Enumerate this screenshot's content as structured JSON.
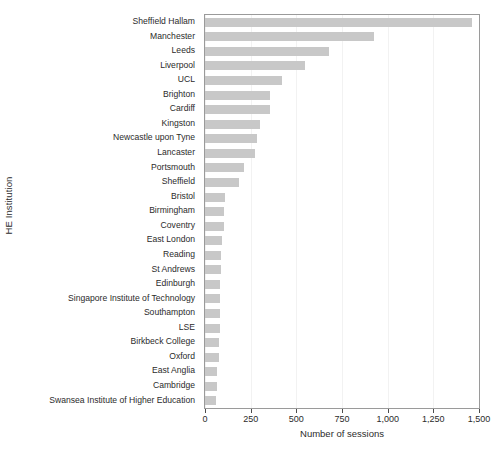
{
  "chart_data": {
    "type": "bar",
    "orientation": "horizontal",
    "title": "",
    "xlabel": "Number of sessions",
    "ylabel": "HE Institution",
    "xlim": [
      0,
      1500
    ],
    "ylim": null,
    "grid": true,
    "legend": null,
    "bar_color": "#c8c8c8",
    "panel_border_color": "#9a9a9a",
    "xticks": [
      0,
      250,
      500,
      750,
      1000,
      1250,
      1500
    ],
    "xticklabels": [
      "0",
      "250",
      "500",
      "750",
      "1,000",
      "1,250",
      "1,500"
    ],
    "categories": [
      "Sheffield Hallam",
      "Manchester",
      "Leeds",
      "Liverpool",
      "UCL",
      "Brighton",
      "Cardiff",
      "Kingston",
      "Newcastle upon Tyne",
      "Lancaster",
      "Portsmouth",
      "Sheffield",
      "Bristol",
      "Birmingham",
      "Coventry",
      "East London",
      "Reading",
      "St Andrews",
      "Edinburgh",
      "Singapore Institute of Technology",
      "Southampton",
      "LSE",
      "Birkbeck College",
      "Oxford",
      "East Anglia",
      "Cambridge",
      "Swansea Institute of Higher Education"
    ],
    "values": [
      1460,
      925,
      680,
      550,
      420,
      356,
      356,
      300,
      285,
      274,
      215,
      184,
      110,
      106,
      102,
      92,
      90,
      86,
      84,
      82,
      80,
      80,
      78,
      74,
      66,
      64,
      62
    ]
  }
}
